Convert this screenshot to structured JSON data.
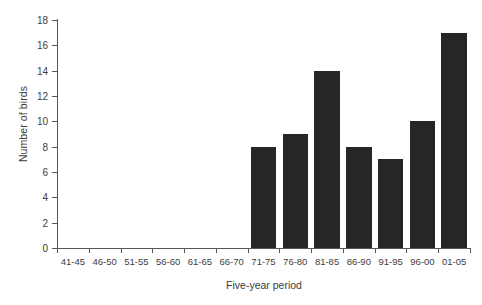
{
  "chart_data": {
    "type": "bar",
    "title": "",
    "xlabel": "Five-year period",
    "ylabel": "Number of birds",
    "categories": [
      "41-45",
      "46-50",
      "51-55",
      "56-60",
      "61-65",
      "66-70",
      "71-75",
      "76-80",
      "81-85",
      "86-90",
      "91-95",
      "96-00",
      "01-05"
    ],
    "values": [
      0,
      0,
      0,
      0,
      0,
      0,
      8,
      9,
      14,
      8,
      7,
      10,
      17
    ],
    "ylim": [
      0,
      18
    ],
    "ytick_labels": [
      "0",
      "2",
      "4",
      "6",
      "8",
      "10",
      "12",
      "14",
      "16",
      "18"
    ],
    "ytick_values": [
      0,
      2,
      4,
      6,
      8,
      10,
      12,
      14,
      16,
      18
    ],
    "grid": false,
    "legend": false,
    "bar_color": "#262626",
    "axis_color": "#555555",
    "background_color": "#ffffff"
  }
}
